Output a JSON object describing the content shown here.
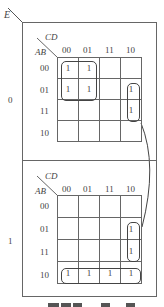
{
  "outer_variable": "E",
  "col_variable": "CD",
  "row_variable": "AB",
  "col_labels": [
    "00",
    "01",
    "11",
    "10"
  ],
  "row_labels": [
    "00",
    "01",
    "11",
    "10"
  ],
  "maps": [
    {
      "e_value": "0",
      "cells": [
        [
          "1",
          "1",
          "",
          ""
        ],
        [
          "1",
          "1",
          "",
          "1"
        ],
        [
          "",
          "",
          "",
          "1"
        ],
        [
          "",
          "",
          "",
          ""
        ]
      ]
    },
    {
      "e_value": "1",
      "cells": [
        [
          "",
          "",
          "",
          ""
        ],
        [
          "",
          "",
          "",
          "1"
        ],
        [
          "",
          "",
          "",
          "1"
        ],
        [
          "1",
          "1",
          "1",
          "1"
        ]
      ]
    }
  ]
}
